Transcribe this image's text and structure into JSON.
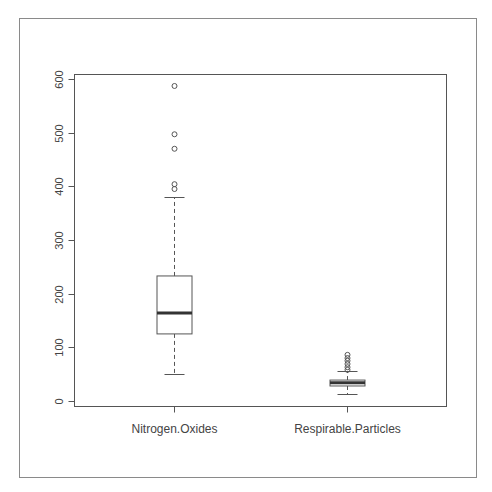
{
  "chart_data": {
    "type": "boxplot",
    "title": "",
    "xlabel": "",
    "ylabel": "",
    "ylim": [
      0,
      600
    ],
    "yticks": [
      0,
      100,
      200,
      300,
      400,
      500,
      600
    ],
    "ytick_labels": [
      "0",
      "100",
      "200",
      "300",
      "400",
      "500",
      "600"
    ],
    "grid": false,
    "categories": [
      "Nitrogen.Oxides",
      "Respirable.Particles"
    ],
    "series": [
      {
        "name": "Nitrogen.Oxides",
        "whisker_low": 50,
        "q1": 125,
        "median": 164,
        "q3": 233,
        "whisker_high": 380,
        "outliers": [
          395,
          404,
          470,
          497,
          587
        ]
      },
      {
        "name": "Respirable.Particles",
        "whisker_low": 13,
        "q1": 28,
        "median": 34,
        "q3": 39,
        "whisker_high": 56,
        "outliers": [
          58,
          63,
          69,
          75,
          80,
          86
        ]
      }
    ]
  }
}
